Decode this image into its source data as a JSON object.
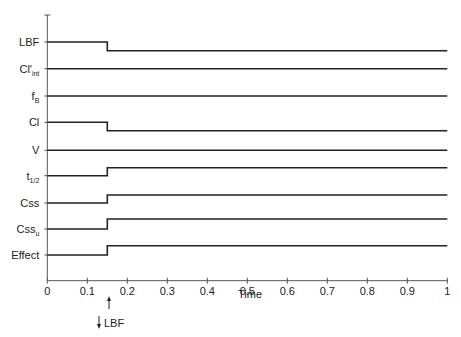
{
  "chart_data": {
    "type": "line",
    "title": "",
    "xlabel": "Time",
    "ylabel": "",
    "xlim": [
      0,
      1
    ],
    "x_ticks": [
      "0",
      "0.1",
      "0.2",
      "0.3",
      "0.4",
      "0.5",
      "0.6",
      "0.7",
      "0.8",
      "0.9",
      "1"
    ],
    "grid": false,
    "legend": null,
    "event": {
      "time": 0.15,
      "label": "LBF",
      "direction": "decrease",
      "marker": "↑",
      "annotation_arrow": "↓"
    },
    "series": [
      {
        "name": "LBF",
        "main": "LBF",
        "sub": "",
        "prime": false,
        "change": "down",
        "x": [
          0,
          0.15,
          0.15,
          1
        ],
        "values": [
          1,
          1,
          0.7,
          0.7
        ]
      },
      {
        "name": "Cl'int",
        "main": "Cl",
        "sub": "int",
        "prime": true,
        "change": "none",
        "x": [
          0,
          1
        ],
        "values": [
          1,
          1
        ]
      },
      {
        "name": "fB",
        "main": "f",
        "sub": "B",
        "prime": false,
        "change": "none",
        "x": [
          0,
          1
        ],
        "values": [
          1,
          1
        ]
      },
      {
        "name": "Cl",
        "main": "Cl",
        "sub": "",
        "prime": false,
        "change": "down",
        "x": [
          0,
          0.15,
          0.15,
          1
        ],
        "values": [
          1,
          1,
          0.7,
          0.7
        ]
      },
      {
        "name": "V",
        "main": "V",
        "sub": "",
        "prime": false,
        "change": "none",
        "x": [
          0,
          1
        ],
        "values": [
          1,
          1
        ]
      },
      {
        "name": "t1/2",
        "main": "t",
        "sub": "1/2",
        "prime": false,
        "change": "up",
        "x": [
          0,
          0.15,
          0.15,
          1
        ],
        "values": [
          1,
          1,
          1.3,
          1.3
        ]
      },
      {
        "name": "Css",
        "main": "Css",
        "sub": "",
        "prime": false,
        "change": "up",
        "x": [
          0,
          0.15,
          0.15,
          1
        ],
        "values": [
          1,
          1,
          1.3,
          1.3
        ]
      },
      {
        "name": "Cssu",
        "main": "Css",
        "sub": "u",
        "prime": false,
        "change": "up",
        "x": [
          0,
          0.15,
          0.15,
          1
        ],
        "values": [
          1,
          1,
          1.35,
          1.35
        ]
      },
      {
        "name": "Effect",
        "main": "Effect",
        "sub": "",
        "prime": false,
        "change": "up",
        "x": [
          0,
          0.15,
          0.15,
          1
        ],
        "values": [
          1,
          1,
          1.3,
          1.3
        ]
      }
    ]
  },
  "labels": {
    "xlabel": "Time",
    "event_label": "LBF"
  },
  "colors": {
    "line": "#222222",
    "axis": "#555555"
  }
}
